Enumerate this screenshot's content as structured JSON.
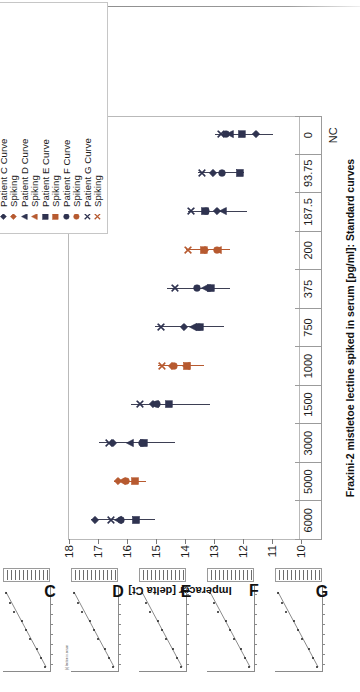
{
  "chart_data": {
    "type": "scatter",
    "title": "Fraxini-2 mistletoe lectine spiked in serum [pg/ml]: Standard curves",
    "xlabel": "",
    "ylabel": "Imperacer [delta Ct]",
    "categories": [
      "6000",
      "5000",
      "3000",
      "1500",
      "1000",
      "750",
      "375",
      "200",
      "187.5",
      "93.75",
      "0"
    ],
    "extra_category_label": "NC",
    "yticks": [
      "18",
      "17",
      "16",
      "15",
      "14",
      "13",
      "12",
      "11",
      "10"
    ],
    "ylim": [
      10,
      18
    ],
    "grid": false,
    "legend_position": "top-right",
    "colors": {
      "dark": "#2f3350",
      "orange": "#b75a30",
      "axis": "#9b9b9b",
      "frame": "#b9b9b9"
    },
    "series": [
      {
        "name": "Patient C Curve",
        "marker": "diamond",
        "color": "#2f3350"
      },
      {
        "name": "Spiking",
        "marker": "diamond",
        "color": "#b75a30"
      },
      {
        "name": "Patient D Curve",
        "marker": "triangle",
        "color": "#2f3350"
      },
      {
        "name": "Spiking",
        "marker": "triangle",
        "color": "#b75a30"
      },
      {
        "name": "Patient E Curve",
        "marker": "square",
        "color": "#2f3350"
      },
      {
        "name": "Spiking",
        "marker": "square",
        "color": "#b75a30"
      },
      {
        "name": "Patient F Curve",
        "marker": "circle",
        "color": "#2f3350"
      },
      {
        "name": "Spiking",
        "marker": "circle",
        "color": "#b75a30"
      },
      {
        "name": "Patient G Curve",
        "marker": "cross",
        "color": "#2f3350"
      },
      {
        "name": "Spiking",
        "marker": "cross",
        "color": "#b75a30"
      }
    ],
    "points": [
      {
        "cat": "6000",
        "color": "dark",
        "err": [
          15.05,
          17.25
        ],
        "marks": [
          {
            "m": "diamond",
            "y": 17.1
          },
          {
            "m": "cross",
            "y": 16.55
          },
          {
            "m": "triangle",
            "y": 16.3
          },
          {
            "m": "circle",
            "y": 16.22
          },
          {
            "m": "square",
            "y": 15.68
          }
        ]
      },
      {
        "cat": "5000",
        "color": "orange",
        "err": [
          15.35,
          16.45
        ],
        "marks": [
          {
            "m": "diamond",
            "y": 16.3
          },
          {
            "m": "circle",
            "y": 16.02
          },
          {
            "m": "square",
            "y": 15.72
          },
          {
            "m": "triangle",
            "y": 16.18
          }
        ]
      },
      {
        "cat": "3000",
        "color": "dark",
        "err": [
          14.35,
          16.95
        ],
        "marks": [
          {
            "m": "cross",
            "y": 16.62
          },
          {
            "m": "diamond",
            "y": 16.5
          },
          {
            "m": "triangle",
            "y": 15.9
          },
          {
            "m": "square",
            "y": 15.42
          },
          {
            "m": "circle",
            "y": 15.48
          }
        ]
      },
      {
        "cat": "1500",
        "color": "dark",
        "err": [
          13.15,
          15.85
        ],
        "marks": [
          {
            "m": "cross",
            "y": 15.55
          },
          {
            "m": "diamond",
            "y": 15.1
          },
          {
            "m": "triangle",
            "y": 15.02
          },
          {
            "m": "circle",
            "y": 14.98
          },
          {
            "m": "square",
            "y": 14.55
          }
        ]
      },
      {
        "cat": "1000",
        "color": "orange",
        "err": [
          13.35,
          14.92
        ],
        "marks": [
          {
            "m": "cross",
            "y": 14.8
          },
          {
            "m": "diamond",
            "y": 14.45
          },
          {
            "m": "circle",
            "y": 14.38
          },
          {
            "m": "square",
            "y": 13.92
          },
          {
            "m": "triangle",
            "y": 13.98
          }
        ]
      },
      {
        "cat": "750",
        "color": "dark",
        "err": [
          12.65,
          15.05
        ],
        "marks": [
          {
            "m": "cross",
            "y": 14.82
          },
          {
            "m": "diamond",
            "y": 14.05
          },
          {
            "m": "triangle",
            "y": 13.72
          },
          {
            "m": "square",
            "y": 13.48
          },
          {
            "m": "circle",
            "y": 13.52
          }
        ]
      },
      {
        "cat": "375",
        "color": "dark",
        "err": [
          12.45,
          14.62
        ],
        "marks": [
          {
            "m": "cross",
            "y": 14.35
          },
          {
            "m": "circle",
            "y": 13.6
          },
          {
            "m": "triangle",
            "y": 13.32
          },
          {
            "m": "square",
            "y": 13.1
          },
          {
            "m": "diamond",
            "y": 13.14
          }
        ]
      },
      {
        "cat": "200",
        "color": "orange",
        "err": [
          12.45,
          13.95
        ],
        "marks": [
          {
            "m": "cross",
            "y": 13.88
          },
          {
            "m": "square",
            "y": 13.35
          },
          {
            "m": "diamond",
            "y": 13.3
          },
          {
            "m": "circle",
            "y": 12.9
          },
          {
            "m": "triangle",
            "y": 12.86
          }
        ]
      },
      {
        "cat": "187.5",
        "color": "dark",
        "err": [
          11.85,
          13.9
        ],
        "marks": [
          {
            "m": "cross",
            "y": 13.78
          },
          {
            "m": "square",
            "y": 13.32
          },
          {
            "m": "circle",
            "y": 13.28
          },
          {
            "m": "diamond",
            "y": 12.88
          },
          {
            "m": "triangle",
            "y": 12.7
          }
        ]
      },
      {
        "cat": "93.75",
        "color": "dark",
        "err": [
          11.95,
          13.55
        ],
        "marks": [
          {
            "m": "cross",
            "y": 13.42
          },
          {
            "m": "diamond",
            "y": 13.05
          },
          {
            "m": "circle",
            "y": 12.72
          },
          {
            "m": "square",
            "y": 12.1
          }
        ]
      },
      {
        "cat": "0",
        "color": "dark",
        "err": [
          10.95,
          12.95
        ],
        "marks": [
          {
            "m": "cross",
            "y": 12.75
          },
          {
            "m": "circle",
            "y": 12.58
          },
          {
            "m": "triangle",
            "y": 12.46
          },
          {
            "m": "square",
            "y": 12.05
          },
          {
            "m": "diamond",
            "y": 11.55
          }
        ]
      }
    ]
  },
  "legend": {
    "items": [
      {
        "label": "Patient C Curve",
        "marker": "diamond",
        "color": "#2f3350"
      },
      {
        "label": "Spiking",
        "marker": "diamond",
        "color": "#b75a30"
      },
      {
        "label": "Patient D Curve",
        "marker": "triangle",
        "color": "#2f3350"
      },
      {
        "label": "Spiking",
        "marker": "triangle",
        "color": "#b75a30"
      },
      {
        "label": "Patient E Curve",
        "marker": "square",
        "color": "#2f3350"
      },
      {
        "label": "Spiking",
        "marker": "square",
        "color": "#b75a30"
      },
      {
        "label": "Patient F Curve",
        "marker": "circle",
        "color": "#2f3350"
      },
      {
        "label": "Spiking",
        "marker": "circle",
        "color": "#b75a30"
      },
      {
        "label": "Patient G Curve",
        "marker": "cross",
        "color": "#2f3350"
      },
      {
        "label": "Spiking",
        "marker": "cross",
        "color": "#b75a30"
      }
    ]
  },
  "thumbnails": {
    "caption": "[c] lectine in serum",
    "items": [
      {
        "letter": "C"
      },
      {
        "letter": "D"
      },
      {
        "letter": "E"
      },
      {
        "letter": "F"
      },
      {
        "letter": "G"
      }
    ]
  }
}
